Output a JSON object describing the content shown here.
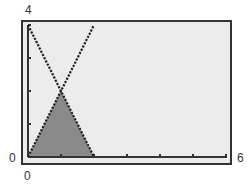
{
  "chart_data": {
    "type": "line",
    "title": "",
    "xlabel": "",
    "ylabel": "",
    "xlim": [
      0,
      6
    ],
    "ylim": [
      0,
      4
    ],
    "grid": false,
    "x_ticks": [
      0,
      1,
      2,
      3,
      4,
      5,
      6
    ],
    "y_ticks": [
      0,
      1,
      2,
      3,
      4
    ],
    "tick_labels": {
      "x_min": "0",
      "x_max": "6",
      "y_min": "0",
      "y_max": "4"
    },
    "series": [
      {
        "name": "y = 4 - 2x",
        "x": [
          0,
          2
        ],
        "y": [
          4,
          0
        ],
        "style": "dotted"
      },
      {
        "name": "y = 2x",
        "x": [
          0,
          2
        ],
        "y": [
          0,
          4
        ],
        "style": "dotted"
      }
    ],
    "shaded_region": {
      "description": "region bounded by y=2x, y=4-2x and y=0",
      "vertices": [
        [
          0,
          0
        ],
        [
          1,
          2
        ],
        [
          2,
          0
        ]
      ],
      "color": "#8a8a8a"
    },
    "intersection_point": [
      1,
      2
    ]
  },
  "colors": {
    "plot_background": "#ececec",
    "frame": "#333333",
    "line": "#222222",
    "shade": "#8a8a8a"
  }
}
